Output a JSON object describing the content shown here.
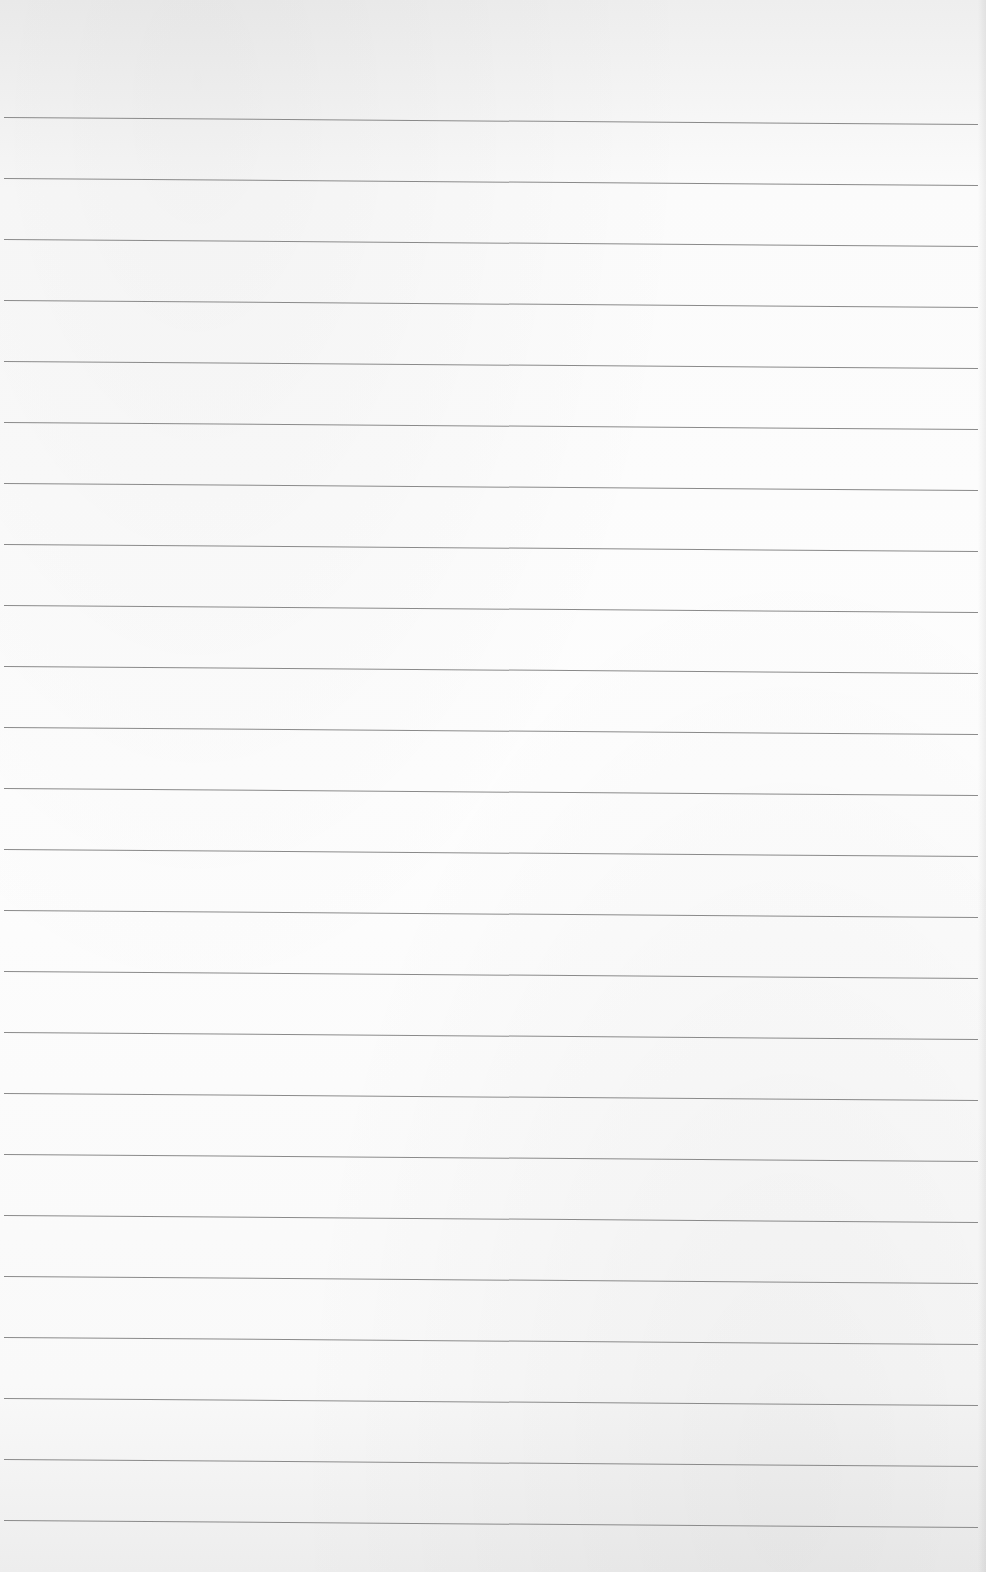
{
  "page": {
    "type": "ruled-paper-scan",
    "paper_color": "#fcfcfc",
    "line_color": "#8a8a8a",
    "rule_count": 24,
    "first_rule_y": 117,
    "rule_spacing": 61,
    "rule_left_x": 4,
    "rule_right_x": 978,
    "rule_slope_px": 7,
    "content_text": ""
  }
}
